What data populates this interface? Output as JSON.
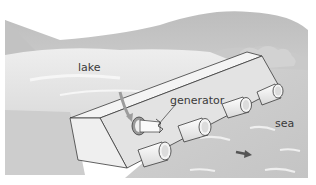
{
  "diagram": {
    "type": "illustration",
    "labels": {
      "lake": "lake",
      "generator": "generator",
      "sea": "sea"
    },
    "elements": {
      "hills": "background hills",
      "barrage": "dam wall",
      "turbine_pipes": 6,
      "flow_arrow": "arrow pointing right in sea"
    },
    "colors": {
      "background": "#ffffff",
      "hills": "#c8c8c8",
      "water_lake": "#e4e4e4",
      "water_sea": "#cfcfcf",
      "wall_top": "#f2f2f2",
      "wall_front": "#e0e0e0",
      "outline": "#3a3a3a",
      "arrow": "#555555"
    }
  }
}
